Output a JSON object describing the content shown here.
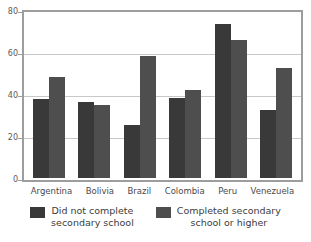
{
  "chart_data": {
    "type": "bar",
    "title": "",
    "subtitle": "",
    "xlabel": "",
    "ylabel": "",
    "ylim": [
      0,
      80
    ],
    "yticks": [
      0,
      20,
      40,
      60,
      80
    ],
    "ytick_labels": [
      "0",
      "20",
      "40",
      "60",
      "80"
    ],
    "grid": true,
    "legend_position": "bottom",
    "categories": [
      "Argentina",
      "Bolivia",
      "Brazil",
      "Colombia",
      "Peru",
      "Venezuela"
    ],
    "series": [
      {
        "name": "Did not complete\nsecondary school",
        "color": "#393939",
        "values": [
          37.5,
          36.2,
          25.3,
          38.0,
          73.5,
          32.5
        ]
      },
      {
        "name": "Completed secondary\nschool or higher",
        "color": "#4e4e4e",
        "values": [
          48.2,
          34.7,
          58.0,
          41.7,
          65.5,
          52.3
        ]
      }
    ]
  },
  "legend": {
    "items": [
      {
        "label": "Did not complete\nsecondary school",
        "color": "#393939"
      },
      {
        "label": "Completed secondary\nschool or higher",
        "color": "#4e4e4e"
      }
    ]
  },
  "colors": {
    "series_0": "#393939",
    "series_1": "#4e4e4e",
    "frame": "#9d9d9d",
    "gridline": "#c8c8c8",
    "background": "#ffffff",
    "text": "#4a4a4a"
  }
}
